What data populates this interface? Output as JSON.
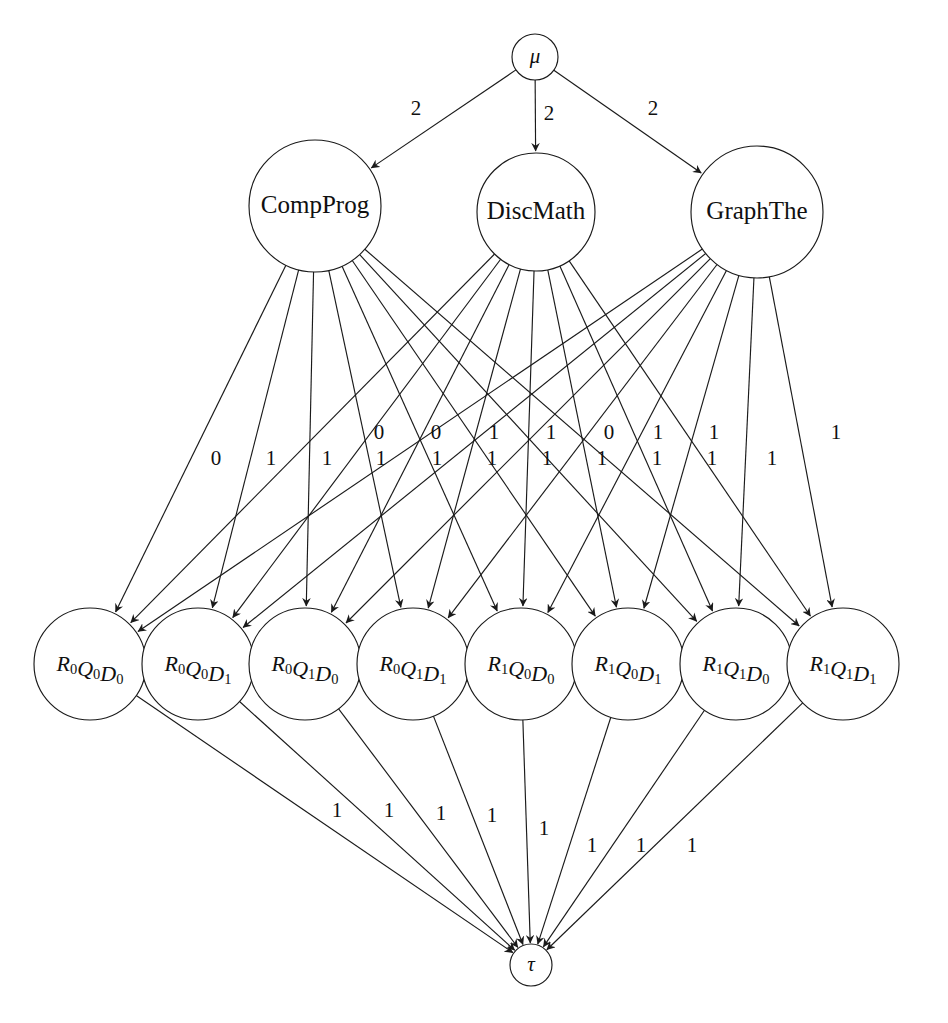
{
  "diagram": {
    "type": "directed-flow-network",
    "background_color": "#ffffff",
    "stroke_color": "#1a1a1a",
    "source": {
      "id": "mu",
      "label": "μ",
      "cx": 535,
      "cy": 57,
      "r": 23
    },
    "sink": {
      "id": "tau",
      "label": "τ",
      "cx": 531,
      "cy": 965,
      "r": 21
    },
    "course_nodes": [
      {
        "id": "compprog",
        "label": "CompProg",
        "cx": 315,
        "cy": 206,
        "r": 66
      },
      {
        "id": "discmath",
        "label": "DiscMath",
        "cx": 536,
        "cy": 212,
        "r": 59
      },
      {
        "id": "graphthe",
        "label": "GraphThe",
        "cx": 757,
        "cy": 212,
        "r": 66
      }
    ],
    "state_nodes": [
      {
        "id": "r0q0d0",
        "base": "R",
        "sub1": "0",
        "base2": "Q",
        "sub2": "0",
        "base3": "D",
        "sub3": "0",
        "label": "R₀Q₀D₀",
        "cx": 90,
        "cy": 664,
        "r": 56
      },
      {
        "id": "r0q0d1",
        "base": "R",
        "sub1": "0",
        "base2": "Q",
        "sub2": "0",
        "base3": "D",
        "sub3": "1",
        "label": "R₀Q₀D₁",
        "cx": 198,
        "cy": 664,
        "r": 56
      },
      {
        "id": "r0q1d0",
        "base": "R",
        "sub1": "0",
        "base2": "Q",
        "sub2": "1",
        "base3": "D",
        "sub3": "0",
        "label": "R₀Q₁D₀",
        "cx": 305,
        "cy": 664,
        "r": 56
      },
      {
        "id": "r0q1d1",
        "base": "R",
        "sub1": "0",
        "base2": "Q",
        "sub2": "1",
        "base3": "D",
        "sub3": "1",
        "label": "R₀Q₁D₁",
        "cx": 413,
        "cy": 664,
        "r": 56
      },
      {
        "id": "r1q0d0",
        "base": "R",
        "sub1": "1",
        "base2": "Q",
        "sub2": "0",
        "base3": "D",
        "sub3": "0",
        "label": "R₁Q₀D₀",
        "cx": 521,
        "cy": 664,
        "r": 56
      },
      {
        "id": "r1q0d1",
        "base": "R",
        "sub1": "1",
        "base2": "Q",
        "sub2": "0",
        "base3": "D",
        "sub3": "1",
        "label": "R₁Q₀D₁",
        "cx": 628,
        "cy": 664,
        "r": 56
      },
      {
        "id": "r1q1d0",
        "base": "R",
        "sub1": "1",
        "base2": "Q",
        "sub2": "1",
        "base3": "D",
        "sub3": "0",
        "label": "R₁Q₁D₀",
        "cx": 736,
        "cy": 664,
        "r": 56
      },
      {
        "id": "r1q1d1",
        "base": "R",
        "sub1": "1",
        "base2": "Q",
        "sub2": "1",
        "base3": "D",
        "sub3": "1",
        "label": "R₁Q₁D₁",
        "cx": 843,
        "cy": 664,
        "r": 56
      }
    ],
    "source_edges": [
      {
        "from": "mu",
        "to": "compprog",
        "weight": "2",
        "label_x": 416,
        "label_y": 110
      },
      {
        "from": "mu",
        "to": "discmath",
        "weight": "2",
        "label_x": 549,
        "label_y": 115
      },
      {
        "from": "mu",
        "to": "graphthe",
        "weight": "2",
        "label_x": 653,
        "label_y": 110
      }
    ],
    "middle_edge_weights_row_upper": [
      {
        "weight": "0",
        "label_x": 379,
        "label_y": 434
      },
      {
        "weight": "0",
        "label_x": 436,
        "label_y": 434
      },
      {
        "weight": "1",
        "label_x": 494,
        "label_y": 434
      },
      {
        "weight": "1",
        "label_x": 551,
        "label_y": 434
      },
      {
        "weight": "0",
        "label_x": 609,
        "label_y": 434
      },
      {
        "weight": "1",
        "label_x": 658,
        "label_y": 434
      },
      {
        "weight": "1",
        "label_x": 714,
        "label_y": 434
      },
      {
        "weight": "1",
        "label_x": 836,
        "label_y": 434
      }
    ],
    "middle_edge_weights_row_lower": [
      {
        "weight": "0",
        "label_x": 216,
        "label_y": 460
      },
      {
        "weight": "1",
        "label_x": 271,
        "label_y": 460
      },
      {
        "weight": "1",
        "label_x": 327,
        "label_y": 460
      },
      {
        "weight": "1",
        "label_x": 381,
        "label_y": 460
      },
      {
        "weight": "1",
        "label_x": 437,
        "label_y": 460
      },
      {
        "weight": "1",
        "label_x": 492,
        "label_y": 460
      },
      {
        "weight": "1",
        "label_x": 547,
        "label_y": 460
      },
      {
        "weight": "1",
        "label_x": 602,
        "label_y": 460
      },
      {
        "weight": "1",
        "label_x": 657,
        "label_y": 460
      },
      {
        "weight": "1",
        "label_x": 712,
        "label_y": 460
      },
      {
        "weight": "1",
        "label_x": 772,
        "label_y": 460
      }
    ],
    "sink_edges": [
      {
        "from": "r0q0d0",
        "weight": "1",
        "label_x": 337,
        "label_y": 812
      },
      {
        "from": "r0q0d1",
        "weight": "1",
        "label_x": 389,
        "label_y": 812
      },
      {
        "from": "r0q1d0",
        "weight": "1",
        "label_x": 441,
        "label_y": 815
      },
      {
        "from": "r0q1d1",
        "weight": "1",
        "label_x": 492,
        "label_y": 817
      },
      {
        "from": "r1q0d0",
        "weight": "1",
        "label_x": 544,
        "label_y": 830
      },
      {
        "from": "r1q0d1",
        "weight": "1",
        "label_x": 592,
        "label_y": 847
      },
      {
        "from": "r1q1d0",
        "weight": "1",
        "label_x": 641,
        "label_y": 847
      },
      {
        "from": "r1q1d1",
        "weight": "1",
        "label_x": 692,
        "label_y": 847
      }
    ],
    "edge_counts": {
      "source_to_courses": 3,
      "courses_to_states": 24,
      "states_to_sink": 8
    }
  }
}
